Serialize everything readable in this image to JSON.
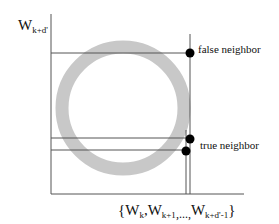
{
  "diagram": {
    "y_axis_label": {
      "main": "W",
      "sub": "k+d'"
    },
    "x_axis_label": {
      "open": "{",
      "terms": [
        {
          "main": "W",
          "sub": "k"
        },
        {
          "main": "W",
          "sub": "k+1"
        },
        {
          "main": "W",
          "sub": "k+d'-1"
        }
      ],
      "separator": ",",
      "ellipsis": ",...,",
      "close": "}"
    },
    "annotations": {
      "false_neighbor": "false neighbor",
      "true_neighbor": "true neighbor"
    },
    "colors": {
      "ring": "#c8c8c8",
      "lines": "#555555",
      "points": "#000000",
      "background": "#ffffff"
    },
    "ring": {
      "cx": 123,
      "cy": 108,
      "r": 61,
      "thickness": 13
    },
    "points": [
      {
        "name": "false-neighbor-point",
        "x": 190,
        "y": 53
      },
      {
        "name": "true-neighbor-point-1",
        "x": 190,
        "y": 139
      },
      {
        "name": "true-neighbor-point-2",
        "x": 186,
        "y": 151
      }
    ]
  }
}
